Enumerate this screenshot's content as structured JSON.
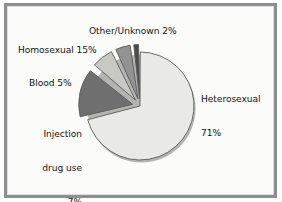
{
  "chart_data": {
    "type": "pie",
    "title": "",
    "categories": [
      "Heterosexual",
      "Homosexual",
      "Injection drug use",
      "Blood",
      "Other/Unknown"
    ],
    "values": [
      71,
      15,
      7,
      5,
      2
    ],
    "value_suffix": "%",
    "legend": "none",
    "labels_position": "outside-callout",
    "exploded_slices": [
      "Homosexual",
      "Injection drug use",
      "Blood",
      "Other/Unknown"
    ],
    "slice_colors": [
      "#e9e9e6",
      "#6f6f6f",
      "#c9c9c4",
      "#939393",
      "#4c4c4c"
    ],
    "slices": [
      {
        "name": "Heterosexual",
        "value": 71,
        "color": "#e9e9e6",
        "exploded": false
      },
      {
        "name": "Homosexual",
        "value": 15,
        "color": "#6f6f6f",
        "exploded": true
      },
      {
        "name": "Injection drug use",
        "value": 7,
        "color": "#c9c9c4",
        "exploded": true
      },
      {
        "name": "Blood",
        "value": 5,
        "color": "#939393",
        "exploded": true
      },
      {
        "name": "Other/Unknown",
        "value": 2,
        "color": "#4c4c4c",
        "exploded": true
      }
    ]
  },
  "labels": {
    "other_unknown": "Other/Unknown 2%",
    "homosexual": "Homosexual 15%",
    "blood": "Blood 5%",
    "injection_line1": "Injection",
    "injection_line2": "drug use",
    "injection_line3": "7%",
    "heterosexual_line1": "Heterosexual",
    "heterosexual_line2": "71%"
  },
  "style": {
    "frame_color": "#8e8e8e",
    "background": "#fbfbf9",
    "text_color": "#131313",
    "outline_color": "#5a5a5a",
    "shadow_color": "#b4b4b0"
  }
}
